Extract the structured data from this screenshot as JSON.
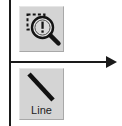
{
  "canvas": {
    "width": 122,
    "height": 126,
    "background_color": "#ffffff"
  },
  "diagram": {
    "stroke_color": "#1a1a1a",
    "vertical_axis": {
      "name": "vertical-reference-line",
      "orientation": "vertical",
      "x": 10,
      "y_start": 0,
      "y_end": 126
    },
    "horizontal_arrow": {
      "name": "horizontal-pointer-arrow",
      "orientation": "horizontal",
      "y": 62,
      "x_start": 10,
      "x_end": 117,
      "arrowhead": "right",
      "arrowhead_style": "solid-triangle"
    }
  },
  "toolbar": {
    "button_face_color": "#d4d4d4",
    "buttons": [
      {
        "id": "zoom",
        "icon": "magnifier-marquee-icon",
        "label": "",
        "has_label": false,
        "selected": false,
        "x": 19,
        "y": 6,
        "width": 45,
        "height": 46
      },
      {
        "id": "line",
        "icon": "diagonal-line-icon",
        "label": "Line",
        "has_label": true,
        "selected": false,
        "x": 19,
        "y": 68,
        "width": 45,
        "height": 52
      }
    ]
  }
}
